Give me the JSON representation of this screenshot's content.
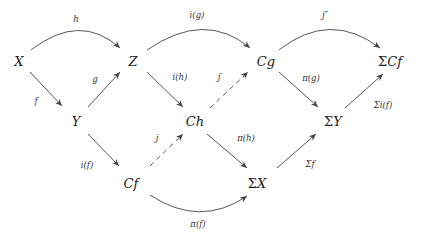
{
  "diagram": {
    "type": "commutative-diagram",
    "nodes": {
      "X": {
        "label": "X",
        "x": 19,
        "y": 66
      },
      "Z": {
        "label": "Z",
        "x": 133,
        "y": 66
      },
      "Cg": {
        "label": "Cg",
        "x": 266,
        "y": 66
      },
      "SCf": {
        "label": "ΣCf",
        "x": 390,
        "y": 66
      },
      "Y": {
        "label": "Y",
        "x": 76,
        "y": 126
      },
      "Ch": {
        "label": "Ch",
        "x": 195,
        "y": 126
      },
      "SY": {
        "label": "ΣY",
        "x": 333,
        "y": 126
      },
      "Cf": {
        "label": "Cf",
        "x": 131,
        "y": 188
      },
      "SX": {
        "label": "ΣX",
        "x": 257,
        "y": 188
      }
    },
    "edges": {
      "h": {
        "label": "h",
        "from": "X",
        "to": "Z",
        "style": "curved"
      },
      "f": {
        "label": "f",
        "from": "X",
        "to": "Y",
        "style": "solid"
      },
      "g": {
        "label": "g",
        "from": "Y",
        "to": "Z",
        "style": "solid"
      },
      "ig": {
        "label": "i(g)",
        "from": "Z",
        "to": "Cg",
        "style": "curved"
      },
      "ih": {
        "label": "i(h)",
        "from": "Z",
        "to": "Ch",
        "style": "solid"
      },
      "jprime": {
        "label": "j′",
        "from": "Ch",
        "to": "Cg",
        "style": "dashed"
      },
      "if": {
        "label": "i(f)",
        "from": "Y",
        "to": "Cf",
        "style": "solid"
      },
      "j": {
        "label": "j",
        "from": "Cf",
        "to": "Ch",
        "style": "dashed"
      },
      "pih": {
        "label": "π(h)",
        "from": "Ch",
        "to": "SX",
        "style": "solid"
      },
      "pig": {
        "label": "π(g)",
        "from": "Cg",
        "to": "SY",
        "style": "solid"
      },
      "jdprime": {
        "label": "j″",
        "from": "Cg",
        "to": "SCf",
        "style": "curved"
      },
      "Sif": {
        "label": "Σi(f)",
        "from": "SY",
        "to": "SCf",
        "style": "solid"
      },
      "Sf": {
        "label": "Σf",
        "from": "SX",
        "to": "SY",
        "style": "solid"
      },
      "pif": {
        "label": "π(f)",
        "from": "Cf",
        "to": "SX",
        "style": "curved"
      }
    }
  }
}
